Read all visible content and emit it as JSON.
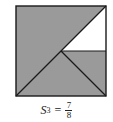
{
  "figure": {
    "fill_color": "#9a9a9a",
    "unshaded_color": "#ffffff",
    "stroke_color": "#1a1a1a"
  },
  "label": {
    "symbol": "S",
    "subscript": "3",
    "equals": "=",
    "numerator": "7",
    "denominator": "8"
  }
}
